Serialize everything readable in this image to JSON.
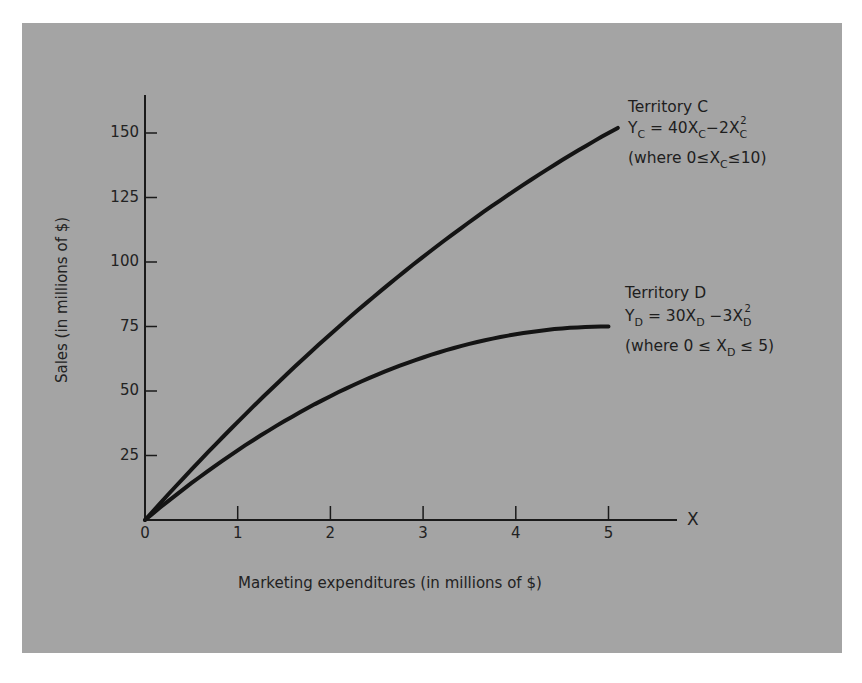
{
  "chart_data": {
    "type": "line",
    "title": "",
    "xlabel": "Marketing expenditures (in millions of $)",
    "ylabel": "Sales (in millions of $)",
    "x_axis_end_label": "X",
    "x_ticks": [
      "0",
      "1",
      "2",
      "3",
      "4",
      "5"
    ],
    "y_ticks": [
      "25",
      "50",
      "75",
      "100",
      "125",
      "150"
    ],
    "xlim": [
      0,
      5.7
    ],
    "ylim": [
      0,
      165
    ],
    "grid": false,
    "legend": "inline annotations at right",
    "series": [
      {
        "name": "Territory C",
        "equation": "Y_C = 40X_C - 2X_C^2",
        "domain": "0 ≤ X_C ≤ 10",
        "x": [
          0,
          0.5,
          1,
          1.5,
          2,
          2.5,
          3,
          3.5,
          4,
          4.5,
          5,
          5.1
        ],
        "values": [
          0,
          19.5,
          38,
          55.5,
          72,
          87.5,
          102,
          115.5,
          128,
          139.5,
          150,
          151.98
        ]
      },
      {
        "name": "Territory D",
        "equation": "Y_D = 30X_D - 3X_D^2",
        "domain": "0 ≤ X_D ≤ 5",
        "x": [
          0,
          0.5,
          1,
          1.5,
          2,
          2.5,
          3,
          3.5,
          4,
          4.5,
          5
        ],
        "values": [
          0,
          14.25,
          27,
          38.25,
          48,
          56.25,
          63,
          68.25,
          72,
          74.25,
          75
        ]
      }
    ]
  },
  "annotations": {
    "c": {
      "title": "Territory C",
      "eq_y": "Y",
      "eq_sub": "C",
      "eq_mid": " = 40X",
      "eq_sub2": "C",
      "eq_tail": "−2X",
      "eq_sub3": "C",
      "eq_sup": "2",
      "cond_a": "(where 0≤X",
      "cond_sub": "C",
      "cond_b": "≤10)"
    },
    "d": {
      "title": "Territory D",
      "eq_y": "Y",
      "eq_sub": "D",
      "eq_mid": " = 30X",
      "eq_sub2": "D",
      "eq_tail": " −3X",
      "eq_sub3": "D",
      "eq_sup": "2",
      "cond_a": "(where 0 ≤ X",
      "cond_sub": "D",
      "cond_b": " ≤ 5)"
    }
  }
}
